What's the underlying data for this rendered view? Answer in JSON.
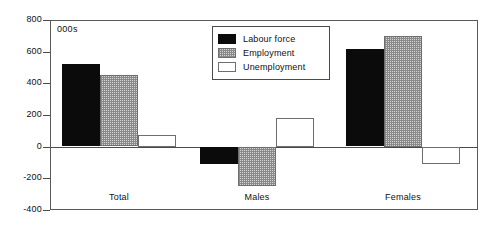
{
  "chart_data": {
    "type": "bar",
    "title": "",
    "subtitle": "",
    "units_label": "000s",
    "xlabel": "",
    "ylabel": "",
    "categories": [
      "Total",
      "Males",
      "Females"
    ],
    "series": [
      {
        "name": "Labour force",
        "values": [
          520,
          -110,
          615
        ],
        "color": "#0b0b0b",
        "fill": "solid-black"
      },
      {
        "name": "Employment",
        "values": [
          450,
          -245,
          700
        ],
        "color": "#d4d4d4",
        "fill": "checker-grey"
      },
      {
        "name": "Unemployment",
        "values": [
          75,
          180,
          -110
        ],
        "color": "#ffffff",
        "fill": "hollow-white"
      }
    ],
    "ylim": [
      -400,
      800
    ],
    "yticks": [
      800,
      600,
      400,
      200,
      0,
      -200,
      -400
    ],
    "ytick_labels": [
      "800",
      "600",
      "400",
      "200",
      "0",
      "-200",
      "-400"
    ],
    "grid": false,
    "legend_position": "top-center",
    "zero_line": true,
    "orientation": "vertical",
    "grouped": true
  },
  "axes": {
    "y": {
      "ticks": [
        {
          "value": 800,
          "label": "800"
        },
        {
          "value": 600,
          "label": "600"
        },
        {
          "value": 400,
          "label": "400"
        },
        {
          "value": 200,
          "label": "200"
        },
        {
          "value": 0,
          "label": "0"
        },
        {
          "value": -200,
          "label": "-200"
        },
        {
          "value": -400,
          "label": "-400"
        }
      ]
    },
    "x": {
      "categories": [
        {
          "label": "Total"
        },
        {
          "label": "Males"
        },
        {
          "label": "Females"
        }
      ]
    }
  },
  "legend": {
    "entries": [
      {
        "label": "Labour force"
      },
      {
        "label": "Employment"
      },
      {
        "label": "Unemployment"
      }
    ]
  },
  "annotations": {
    "units": "000s"
  }
}
